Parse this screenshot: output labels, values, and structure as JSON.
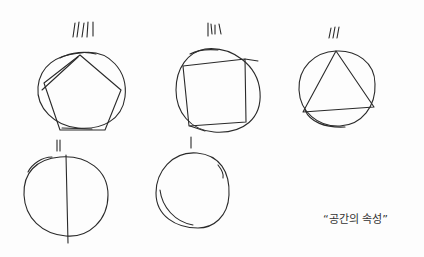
{
  "caption": "“공간의 속성”",
  "figures": [
    {
      "shape": "circle-with-inscribed-pentagon",
      "tally": 5
    },
    {
      "shape": "circle-with-inscribed-square",
      "tally": 4
    },
    {
      "shape": "circle-with-inscribed-triangle",
      "tally": 3
    },
    {
      "shape": "circle-with-vertical-line",
      "tally": 2
    },
    {
      "shape": "circle",
      "tally": 1
    }
  ]
}
